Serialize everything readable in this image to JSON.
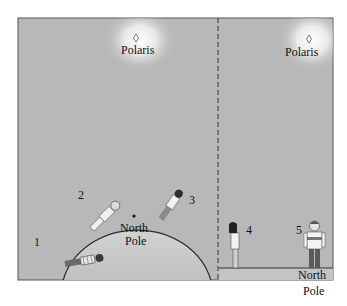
{
  "diagram": {
    "colors": {
      "background": "#b8b8b8",
      "frame": "#444444",
      "glow": "#ffffff",
      "earth": "#c9c9c9",
      "ink": "#111111"
    },
    "left_panel": {
      "star_label": "Polaris",
      "pole_label_line1": "North",
      "pole_label_line2": "Pole",
      "figures": [
        {
          "id": "1",
          "label": "1",
          "pose": "lying nearly horizontal on left side of globe"
        },
        {
          "id": "2",
          "label": "2",
          "pose": "tilted about 45 degrees on globe"
        },
        {
          "id": "3",
          "label": "3",
          "pose": "slightly tilted near top of globe"
        }
      ]
    },
    "right_panel": {
      "star_label": "Polaris",
      "pole_label_line1": "North",
      "pole_label_line2": "Pole",
      "figures": [
        {
          "id": "4",
          "label": "4",
          "pose": "standing, leaning back looking up"
        },
        {
          "id": "5",
          "label": "5",
          "pose": "standing upright at North Pole"
        }
      ]
    }
  }
}
